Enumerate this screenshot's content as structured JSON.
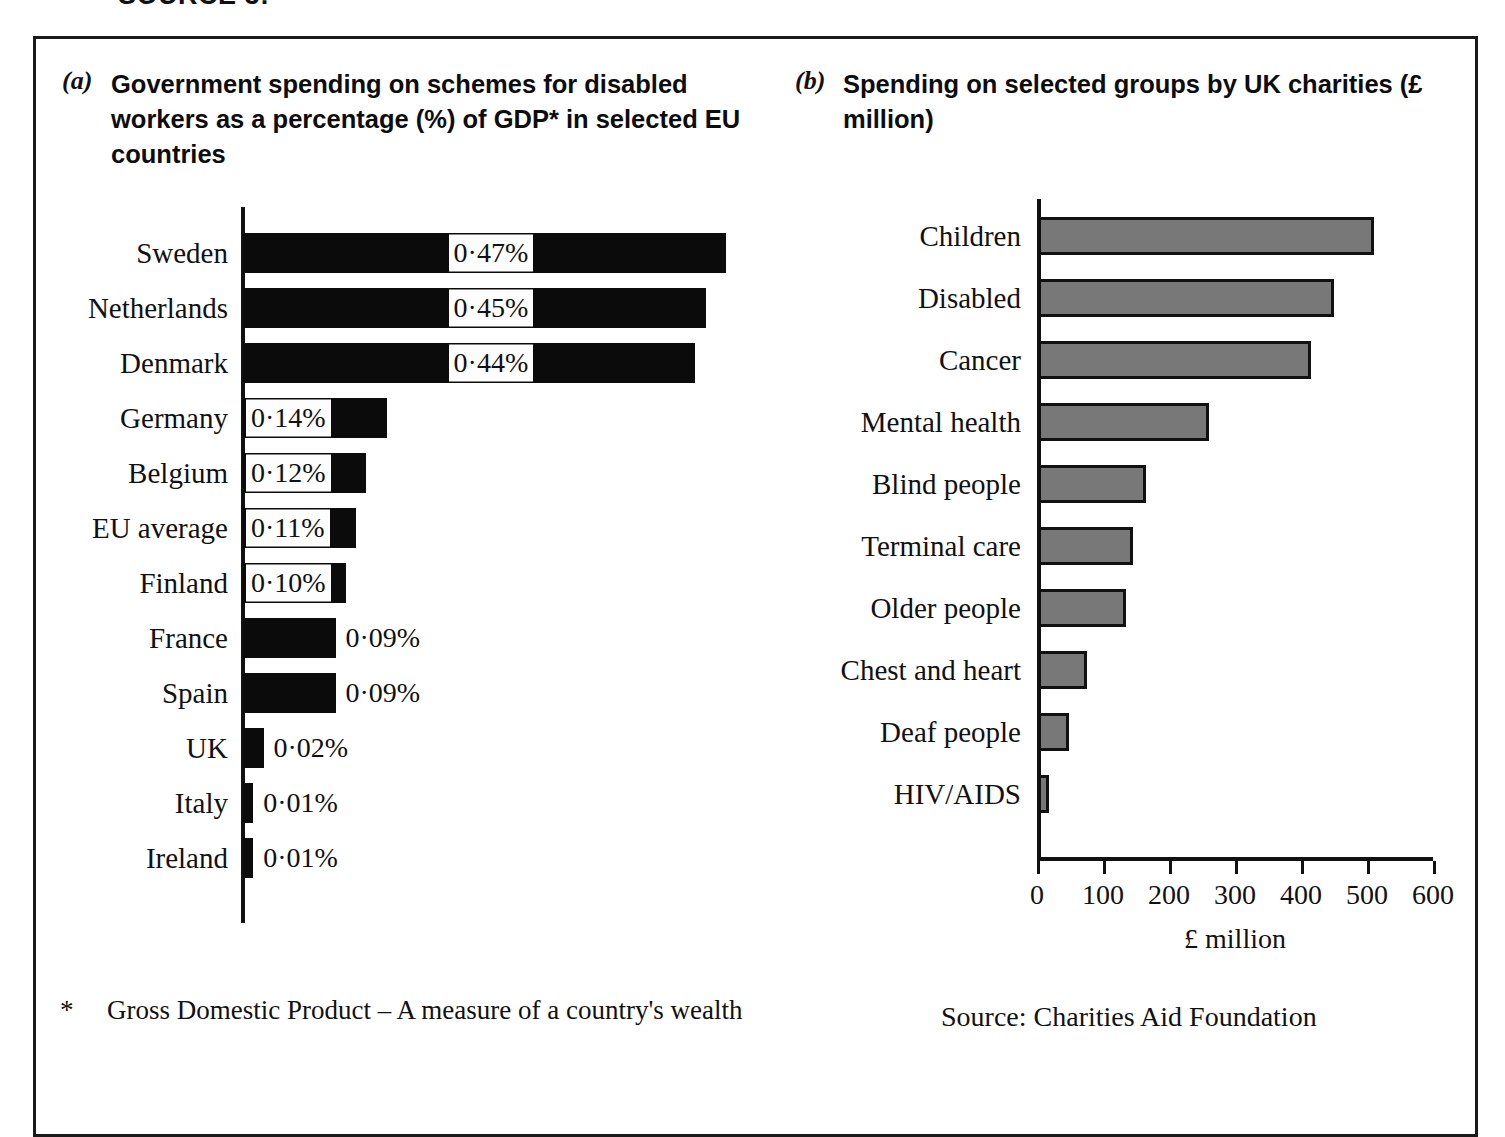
{
  "header": {
    "source_label": "SOURCE 3:"
  },
  "panel_a": {
    "letter": "(a)",
    "title": "Government spending on schemes for disabled workers as a percentage (%) of GDP* in selected EU countries",
    "footnote_marker": "*",
    "footnote": "Gross Domestic Product – A measure of a country's wealth"
  },
  "panel_b": {
    "letter": "(b)",
    "title": "Spending on selected groups by UK charities (£ million)",
    "source": "Source:  Charities Aid Foundation"
  },
  "chart_data": [
    {
      "type": "bar",
      "orientation": "horizontal",
      "title": "Government spending on schemes for disabled workers as a percentage (%) of GDP* in selected EU countries",
      "xlabel": "",
      "ylabel": "",
      "unit": "%",
      "grid": false,
      "legend": "none",
      "axis_visible": "y-only",
      "categories": [
        "Sweden",
        "Netherlands",
        "Denmark",
        "Germany",
        "Belgium",
        "EU average",
        "Finland",
        "France",
        "Spain",
        "UK",
        "Italy",
        "Ireland"
      ],
      "values": [
        0.47,
        0.45,
        0.44,
        0.14,
        0.12,
        0.11,
        0.1,
        0.09,
        0.09,
        0.02,
        0.01,
        0.01
      ],
      "data_labels": [
        "0·47%",
        "0·45%",
        "0·44%",
        "0·14%",
        "0·12%",
        "0·11%",
        "0·10%",
        "0·09%",
        "0·09%",
        "0·02%",
        "0·01%",
        "0·01%"
      ],
      "label_position": [
        "inside",
        "inside",
        "inside",
        "inside",
        "inside",
        "inside",
        "inside",
        "outside",
        "outside",
        "outside",
        "outside",
        "outside"
      ],
      "bar_color": "#0b0b0b",
      "xlim": [
        0,
        0.47
      ]
    },
    {
      "type": "bar",
      "orientation": "horizontal",
      "title": "Spending on selected groups by UK charities (£ million)",
      "xlabel": "£ million",
      "ylabel": "",
      "unit": "£ million",
      "grid": false,
      "legend": "none",
      "axis_visible": "both",
      "categories": [
        "Children",
        "Disabled",
        "Cancer",
        "Mental health",
        "Blind people",
        "Terminal care",
        "Older people",
        "Chest and heart",
        "Deaf people",
        "HIV/AIDS"
      ],
      "values": [
        510,
        450,
        415,
        260,
        165,
        145,
        135,
        75,
        48,
        18
      ],
      "xticks": [
        0,
        100,
        200,
        300,
        400,
        500,
        600
      ],
      "xticklabels": [
        "0",
        "100",
        "200",
        "300",
        "400",
        "500",
        "600"
      ],
      "xlim": [
        0,
        600
      ],
      "bar_color": "#787878",
      "bar_edge_color": "#111111"
    }
  ]
}
